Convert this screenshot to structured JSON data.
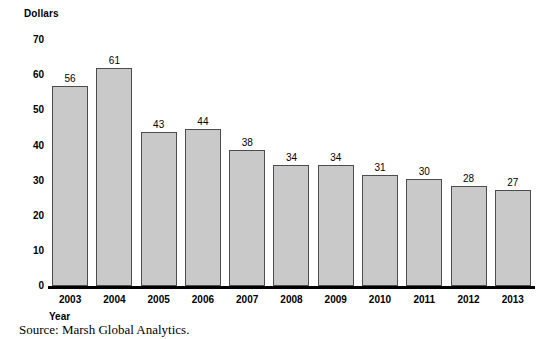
{
  "chart_data": {
    "type": "bar",
    "title": "",
    "subtitle": "",
    "xlabel": "Year",
    "ylabel": "Dollars",
    "categories": [
      "2003",
      "2004",
      "2005",
      "2006",
      "2007",
      "2008",
      "2009",
      "2010",
      "2011",
      "2012",
      "2013"
    ],
    "values": [
      56,
      61,
      43,
      44,
      38,
      34,
      34,
      31,
      30,
      28,
      27
    ],
    "data_labels": [
      "56",
      "61",
      "43",
      "44",
      "38",
      "34",
      "34",
      "31",
      "30",
      "28",
      "27"
    ],
    "ylim": [
      0,
      70
    ],
    "ytick_labels": [
      "70",
      "60",
      "50",
      "40",
      "30",
      "20",
      "10",
      "0"
    ],
    "ytick_values": [
      70,
      60,
      50,
      40,
      30,
      20,
      10,
      0
    ],
    "grid": false,
    "legend": null,
    "legend_position": "none",
    "annotations": [
      "Source: Marsh Global Analytics."
    ],
    "bar_fill_color": "#c9c9c9",
    "bar_border_color": "#4c4c4c",
    "axis_color": "#000000"
  },
  "source_note": "Source: Marsh Global Analytics."
}
